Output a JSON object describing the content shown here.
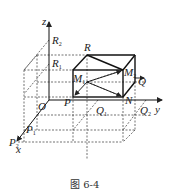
{
  "figure": {
    "caption": "图 6-4",
    "axes": {
      "x": "x",
      "y": "y",
      "z": "z",
      "origin": "O"
    },
    "points": {
      "R": "R",
      "R1": "R",
      "R1_sub": "1",
      "R2": "R",
      "R2_sub": "2",
      "M1": "M",
      "M1_sub": "1",
      "M2": "M",
      "M2_sub": "2",
      "Q": "Q",
      "P": "P",
      "N": "N",
      "Q1": "Q",
      "Q1_sub": "1",
      "Q2": "Q",
      "Q2_sub": "2",
      "P1": "P",
      "P1_sub": "1",
      "P2": "P",
      "P2_sub": "2"
    }
  }
}
